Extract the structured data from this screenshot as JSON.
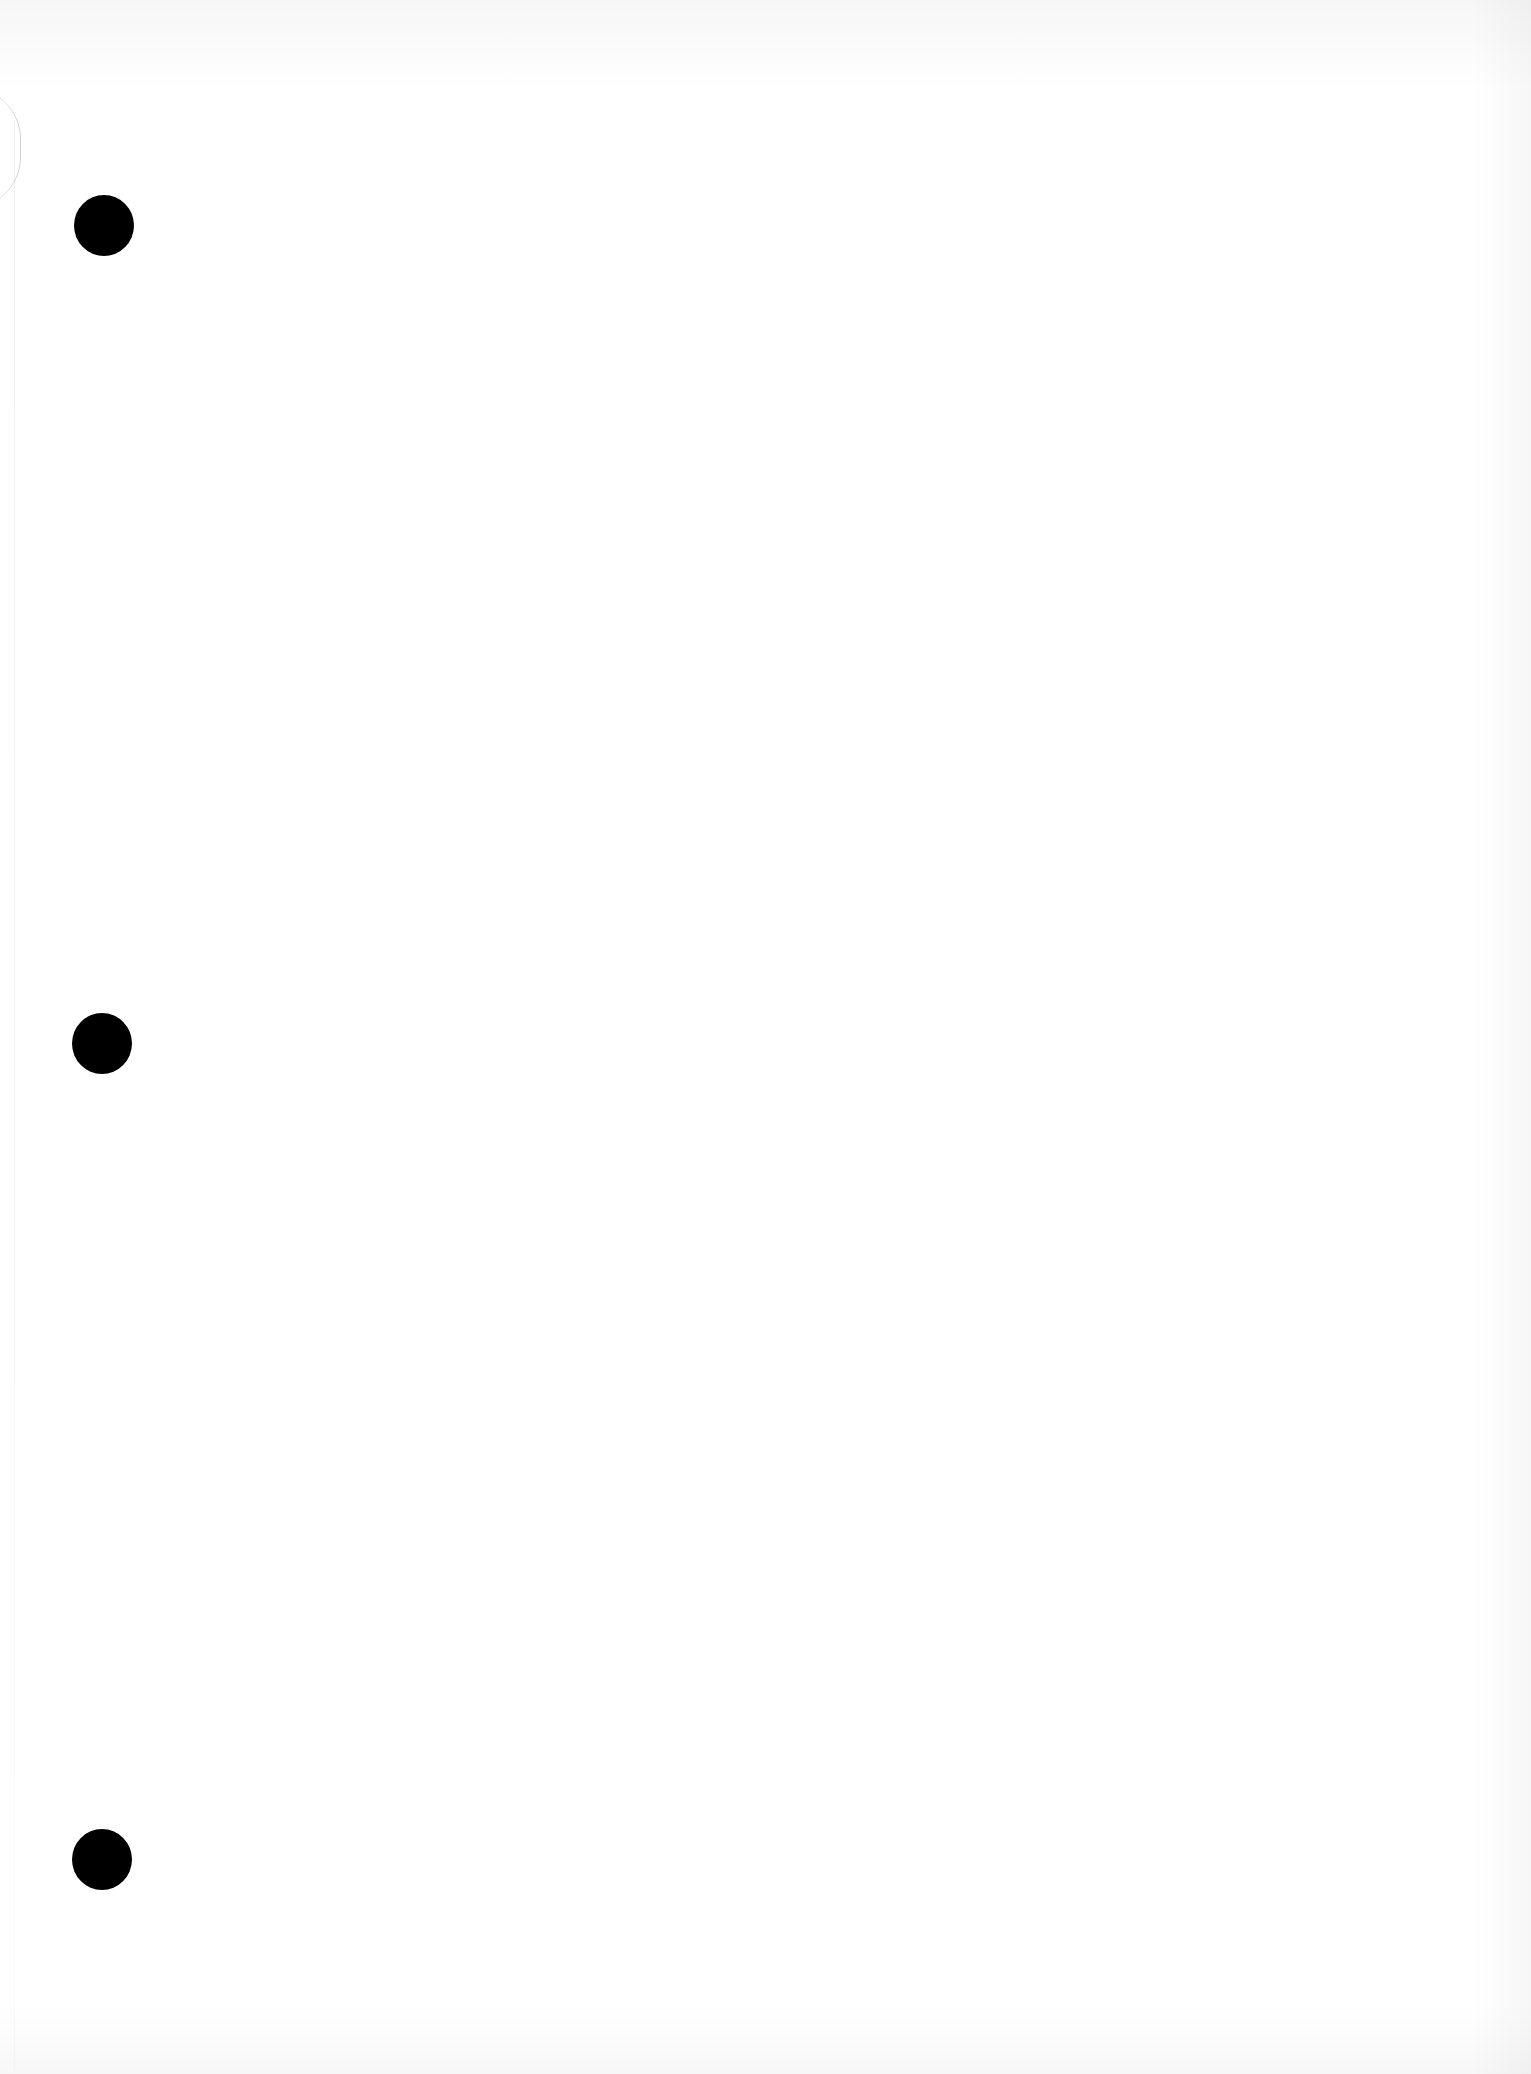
{
  "document": {
    "type": "blank-page",
    "background_color": "#ffffff",
    "content_text": "",
    "punch_holes": [
      {
        "position": "top",
        "color": "#000000"
      },
      {
        "position": "middle",
        "color": "#000000"
      },
      {
        "position": "bottom",
        "color": "#000000"
      }
    ]
  }
}
